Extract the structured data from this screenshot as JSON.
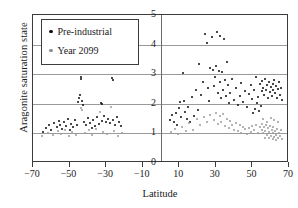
{
  "chart_data": {
    "type": "scatter",
    "title": "",
    "xlabel": "Latitude",
    "ylabel": "Aragonite saturation state",
    "xlim": [
      -70,
      70
    ],
    "ylim": [
      0,
      5
    ],
    "xticks": [
      -70,
      -50,
      -30,
      -10,
      10,
      30,
      50,
      70
    ],
    "xticklabels": [
      "−70",
      "−50",
      "−30",
      "−10",
      "10",
      "30",
      "50",
      "70"
    ],
    "yticks": [
      0,
      1,
      2,
      3,
      4,
      5
    ],
    "yticklabels": [
      "0",
      "1",
      "2",
      "3",
      "4",
      "5"
    ],
    "grid": "horizontal gridlines at y = 1,2,3,4 plus vertical line at x = 0",
    "legend": {
      "position": "upper-left inside axes",
      "entries": [
        {
          "label": "Pre-industrial",
          "marker": "dot",
          "color": "#0d0d0d"
        },
        {
          "label": "Year 2099",
          "marker": "dot",
          "color": "#9b9b9b"
        }
      ]
    },
    "series": [
      {
        "name": "Pre-industrial",
        "color": "#0d0d0d",
        "points": [
          [
            -64.5,
            1.05
          ],
          [
            -63.0,
            1.18
          ],
          [
            -61.5,
            1.3
          ],
          [
            -60.0,
            1.12
          ],
          [
            -58.5,
            1.35
          ],
          [
            -57.0,
            1.22
          ],
          [
            -56.0,
            1.42
          ],
          [
            -55.0,
            1.28
          ],
          [
            -54.0,
            1.15
          ],
          [
            -53.0,
            1.38
          ],
          [
            -52.0,
            1.25
          ],
          [
            -51.0,
            1.48
          ],
          [
            -50.0,
            1.1
          ],
          [
            -49.0,
            1.33
          ],
          [
            -48.0,
            1.2
          ],
          [
            -47.0,
            1.45
          ],
          [
            -46.0,
            1.3
          ],
          [
            -45.5,
            2.05
          ],
          [
            -45.0,
            2.18
          ],
          [
            -44.5,
            2.3
          ],
          [
            -44.0,
            2.85
          ],
          [
            -43.5,
            2.92
          ],
          [
            -43.0,
            2.1
          ],
          [
            -42.5,
            1.95
          ],
          [
            -42.0,
            1.4
          ],
          [
            -41.0,
            1.28
          ],
          [
            -40.0,
            1.52
          ],
          [
            -39.0,
            1.35
          ],
          [
            -38.0,
            1.18
          ],
          [
            -37.0,
            1.44
          ],
          [
            -36.0,
            1.26
          ],
          [
            -35.0,
            1.55
          ],
          [
            -34.0,
            1.32
          ],
          [
            -33.0,
            2.02
          ],
          [
            -32.5,
            1.98
          ],
          [
            -32.0,
            1.42
          ],
          [
            -31.0,
            1.6
          ],
          [
            -30.0,
            1.38
          ],
          [
            -29.0,
            1.5
          ],
          [
            -28.0,
            1.34
          ],
          [
            -27.0,
            2.88
          ],
          [
            -26.5,
            2.82
          ],
          [
            -26.0,
            1.46
          ],
          [
            -25.0,
            1.3
          ],
          [
            -24.0,
            1.55
          ],
          [
            -23.0,
            1.4
          ],
          [
            -22.0,
            1.26
          ],
          [
            5.0,
            1.45
          ],
          [
            6.0,
            1.62
          ],
          [
            7.0,
            1.38
          ],
          [
            8.0,
            1.7
          ],
          [
            9.0,
            1.3
          ],
          [
            10.0,
            1.85
          ],
          [
            10.5,
            2.05
          ],
          [
            11.0,
            1.55
          ],
          [
            12.0,
            3.05
          ],
          [
            12.5,
            2.1
          ],
          [
            13.0,
            1.72
          ],
          [
            14.0,
            1.48
          ],
          [
            15.0,
            1.9
          ],
          [
            16.0,
            1.4
          ],
          [
            17.0,
            2.22
          ],
          [
            18.0,
            1.58
          ],
          [
            19.0,
            2.45
          ],
          [
            20.0,
            1.8
          ],
          [
            21.0,
            3.35
          ],
          [
            22.0,
            2.3
          ],
          [
            23.0,
            2.75
          ],
          [
            24.0,
            4.35
          ],
          [
            25.0,
            4.05
          ],
          [
            25.5,
            2.55
          ],
          [
            26.0,
            2.1
          ],
          [
            27.0,
            3.2
          ],
          [
            28.0,
            4.25
          ],
          [
            28.5,
            3.15
          ],
          [
            29.0,
            2.6
          ],
          [
            29.5,
            2.9
          ],
          [
            30.0,
            3.28
          ],
          [
            30.5,
            4.42
          ],
          [
            31.0,
            2.35
          ],
          [
            31.5,
            3.12
          ],
          [
            32.0,
            2.72
          ],
          [
            32.5,
            4.3
          ],
          [
            33.0,
            2.18
          ],
          [
            33.5,
            3.08
          ],
          [
            34.0,
            2.48
          ],
          [
            34.5,
            4.18
          ],
          [
            35.0,
            2.82
          ],
          [
            35.5,
            2.25
          ],
          [
            36.0,
            3.42
          ],
          [
            36.5,
            2.65
          ],
          [
            37.0,
            2.02
          ],
          [
            38.0,
            2.38
          ],
          [
            39.0,
            2.85
          ],
          [
            40.0,
            2.12
          ],
          [
            41.0,
            2.55
          ],
          [
            42.0,
            1.95
          ],
          [
            43.0,
            2.28
          ],
          [
            44.0,
            2.7
          ],
          [
            45.0,
            2.05
          ],
          [
            46.0,
            2.42
          ],
          [
            47.0,
            1.88
          ],
          [
            48.0,
            2.32
          ],
          [
            49.0,
            2.62
          ],
          [
            50.0,
            2.15
          ],
          [
            51.0,
            2.48
          ],
          [
            52.0,
            2.9
          ],
          [
            53.0,
            2.22
          ],
          [
            54.0,
            2.68
          ],
          [
            55.0,
            2.42
          ],
          [
            55.5,
            2.78
          ],
          [
            56.0,
            2.55
          ],
          [
            56.5,
            2.3
          ],
          [
            57.0,
            2.85
          ],
          [
            57.5,
            2.48
          ],
          [
            58.0,
            2.62
          ],
          [
            58.5,
            2.2
          ],
          [
            59.0,
            2.75
          ],
          [
            59.5,
            2.4
          ],
          [
            60.0,
            2.58
          ],
          [
            60.5,
            2.28
          ],
          [
            61.0,
            2.68
          ],
          [
            61.5,
            2.45
          ],
          [
            62.0,
            2.82
          ],
          [
            62.5,
            2.35
          ],
          [
            63.0,
            2.6
          ],
          [
            63.5,
            2.18
          ],
          [
            64.0,
            2.5
          ],
          [
            64.5,
            2.72
          ],
          [
            65.0,
            2.3
          ],
          [
            65.5,
            2.55
          ],
          [
            66.0,
            2.12
          ],
          [
            54.5,
            1.92
          ],
          [
            53.5,
            1.75
          ],
          [
            52.5,
            2.02
          ],
          [
            51.5,
            1.82
          ],
          [
            50.5,
            1.7
          ]
        ]
      },
      {
        "name": "Year 2099",
        "color": "#9b9b9b",
        "points": [
          [
            -65.0,
            0.92
          ],
          [
            -62.0,
            1.02
          ],
          [
            -59.0,
            0.95
          ],
          [
            -56.5,
            1.08
          ],
          [
            -54.5,
            0.98
          ],
          [
            -52.5,
            1.12
          ],
          [
            -50.5,
            0.9
          ],
          [
            -48.5,
            1.05
          ],
          [
            -46.5,
            0.96
          ],
          [
            -44.0,
            1.85
          ],
          [
            -43.0,
            1.78
          ],
          [
            -41.5,
            1.0
          ],
          [
            -39.5,
            1.1
          ],
          [
            -37.5,
            0.94
          ],
          [
            -35.5,
            1.15
          ],
          [
            -33.5,
            1.72
          ],
          [
            -31.5,
            1.05
          ],
          [
            -29.5,
            0.98
          ],
          [
            -27.5,
            1.9
          ],
          [
            -25.5,
            1.08
          ],
          [
            -23.5,
            0.92
          ],
          [
            -21.5,
            1.0
          ],
          [
            5.5,
            1.05
          ],
          [
            7.5,
            1.15
          ],
          [
            9.5,
            0.98
          ],
          [
            11.5,
            1.22
          ],
          [
            13.5,
            1.08
          ],
          [
            15.5,
            1.35
          ],
          [
            17.5,
            1.12
          ],
          [
            19.5,
            1.48
          ],
          [
            21.5,
            1.28
          ],
          [
            23.5,
            1.55
          ],
          [
            25.0,
            1.38
          ],
          [
            27.0,
            1.62
          ],
          [
            29.0,
            1.45
          ],
          [
            30.0,
            1.7
          ],
          [
            31.0,
            1.32
          ],
          [
            32.0,
            1.58
          ],
          [
            33.0,
            1.4
          ],
          [
            34.0,
            1.65
          ],
          [
            35.0,
            1.25
          ],
          [
            36.0,
            1.5
          ],
          [
            37.0,
            1.18
          ],
          [
            38.0,
            1.42
          ],
          [
            39.0,
            1.3
          ],
          [
            40.0,
            1.12
          ],
          [
            41.0,
            1.35
          ],
          [
            42.0,
            1.08
          ],
          [
            43.0,
            1.28
          ],
          [
            44.0,
            1.02
          ],
          [
            45.0,
            1.22
          ],
          [
            46.0,
            1.15
          ],
          [
            47.0,
            0.98
          ],
          [
            48.0,
            1.18
          ],
          [
            49.0,
            1.05
          ],
          [
            50.0,
            1.25
          ],
          [
            51.0,
            1.1
          ],
          [
            52.0,
            1.3
          ],
          [
            53.0,
            1.02
          ],
          [
            54.0,
            1.2
          ],
          [
            55.0,
            1.12
          ],
          [
            55.5,
            1.32
          ],
          [
            56.0,
            1.0
          ],
          [
            56.5,
            1.22
          ],
          [
            57.0,
            1.08
          ],
          [
            57.5,
            1.28
          ],
          [
            58.0,
            0.95
          ],
          [
            58.5,
            1.18
          ],
          [
            59.0,
            1.05
          ],
          [
            59.5,
            1.25
          ],
          [
            60.0,
            0.9
          ],
          [
            60.5,
            1.12
          ],
          [
            61.0,
            1.0
          ],
          [
            61.5,
            1.2
          ],
          [
            62.0,
            0.88
          ],
          [
            62.5,
            1.08
          ],
          [
            63.0,
            0.96
          ],
          [
            63.5,
            1.15
          ],
          [
            64.0,
            0.85
          ],
          [
            64.5,
            1.02
          ],
          [
            65.0,
            0.92
          ],
          [
            65.5,
            1.1
          ],
          [
            66.0,
            0.82
          ],
          [
            63.0,
            0.78
          ],
          [
            61.0,
            0.8
          ],
          [
            59.0,
            0.84
          ],
          [
            57.0,
            0.86
          ],
          [
            62.0,
            1.45
          ],
          [
            60.0,
            1.52
          ],
          [
            58.0,
            1.4
          ],
          [
            56.0,
            1.48
          ],
          [
            64.0,
            1.38
          ]
        ]
      }
    ]
  }
}
